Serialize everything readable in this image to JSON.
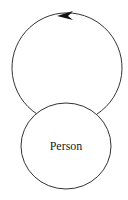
{
  "diagram": {
    "type": "state-diagram",
    "nodes": [
      {
        "id": "person",
        "label": "Person"
      }
    ],
    "edges": [
      {
        "from": "person",
        "to": "person",
        "kind": "self-loop",
        "direction": "counter-clockwise"
      }
    ],
    "colors": {
      "stroke": "#333333",
      "background": "#ffffff",
      "text": "#1a1a1a"
    }
  }
}
